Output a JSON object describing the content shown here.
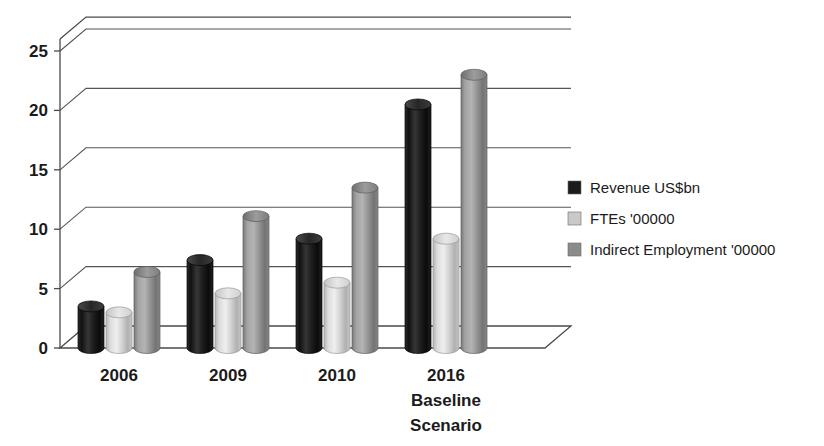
{
  "chart_data": {
    "type": "bar",
    "title": "",
    "subtitle": "",
    "xlabel": "",
    "ylabel": "",
    "categories": [
      "2006",
      "2009",
      "2010",
      "2016 Baseline Scenario"
    ],
    "category_lines": [
      [
        "2006"
      ],
      [
        "2009"
      ],
      [
        "2010"
      ],
      [
        "2016",
        "Baseline",
        "Scenario"
      ]
    ],
    "series": [
      {
        "name": "Revenue US$bn",
        "color": "#1b1b1b",
        "values": [
          3.5,
          7.4,
          9.2,
          20.5
        ]
      },
      {
        "name": "FTEs '00000",
        "color": "#c9c9c9",
        "values": [
          3.0,
          4.6,
          5.5,
          9.2
        ]
      },
      {
        "name": "Indirect Employment '00000",
        "color": "#8b8b8b",
        "values": [
          6.4,
          11.1,
          13.5,
          23.0
        ]
      }
    ],
    "ylim": [
      0,
      26
    ],
    "yticks": [
      0,
      5,
      10,
      15,
      20,
      25
    ],
    "ytick_labels": [
      "0",
      "5",
      "10",
      "15",
      "20",
      "25"
    ],
    "grid": true,
    "legend_position": "right",
    "style": "3d-cylinder",
    "legend_entries": [
      {
        "label": "Revenue US$bn",
        "swatch": "#1b1b1b"
      },
      {
        "label": "FTEs '00000",
        "swatch": "#c9c9c9"
      },
      {
        "label": "Indirect Employment '00000",
        "swatch": "#8b8b8b"
      }
    ]
  },
  "colors": {
    "background": "#ffffff",
    "axis": "#4a4a4a",
    "grid": "#555555",
    "text": "#1b1b1b",
    "series_dark": "#1b1b1b",
    "series_light": "#c9c9c9",
    "series_mid": "#8b8b8b"
  }
}
